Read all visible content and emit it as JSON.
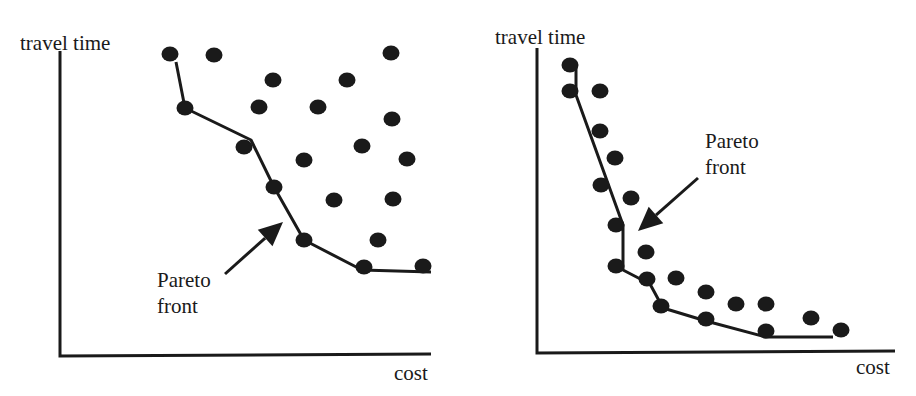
{
  "figure": {
    "panels": [
      {
        "id": "left",
        "y_axis_label": "travel time",
        "x_axis_label": "cost",
        "annotation": {
          "line1": "Pareto",
          "line2": "front"
        },
        "label_pos": {
          "ylabel": [
            20,
            50
          ],
          "xlabel": [
            394,
            380
          ],
          "ann1": [
            157,
            287
          ],
          "ann2": [
            157,
            313
          ]
        },
        "axis": {
          "origin": [
            60,
            356
          ],
          "y_top": 51,
          "x_end": 431
        },
        "arrow": {
          "tail": [
            225,
            274
          ],
          "tip": [
            283,
            222
          ]
        },
        "points": [
          [
            170,
            54
          ],
          [
            214,
            55
          ],
          [
            391,
            53
          ],
          [
            273,
            80
          ],
          [
            347,
            80
          ],
          [
            185,
            108
          ],
          [
            259,
            107
          ],
          [
            318,
            107
          ],
          [
            392,
            119
          ],
          [
            244,
            147
          ],
          [
            362,
            146
          ],
          [
            304,
            160
          ],
          [
            407,
            159
          ],
          [
            274,
            187
          ],
          [
            334,
            200
          ],
          [
            393,
            199
          ],
          [
            304,
            240
          ],
          [
            378,
            240
          ],
          [
            364,
            267
          ],
          [
            423,
            266
          ]
        ],
        "pareto_front": [
          [
            176,
            62
          ],
          [
            185,
            108
          ],
          [
            251,
            140
          ],
          [
            274,
            187
          ],
          [
            304,
            240
          ],
          [
            362,
            270
          ],
          [
            431,
            272
          ]
        ]
      },
      {
        "id": "right",
        "y_axis_label": "travel time",
        "x_axis_label": "cost",
        "annotation": {
          "line1": "Pareto",
          "line2": "front"
        },
        "label_pos": {
          "ylabel": [
            495,
            44
          ],
          "xlabel": [
            856,
            374
          ],
          "ann1": [
            705,
            148
          ],
          "ann2": [
            705,
            174
          ]
        },
        "axis": {
          "origin": [
            537,
            353
          ],
          "y_top": 48,
          "x_end": 895
        },
        "arrow": {
          "tail": [
            698,
            178
          ],
          "tip": [
            638,
            231
          ]
        },
        "points": [
          [
            570,
            65
          ],
          [
            570,
            91
          ],
          [
            600,
            91
          ],
          [
            600,
            131
          ],
          [
            615,
            158
          ],
          [
            601,
            185
          ],
          [
            631,
            198
          ],
          [
            616,
            225
          ],
          [
            646,
            252
          ],
          [
            616,
            266
          ],
          [
            647,
            279
          ],
          [
            676,
            278
          ],
          [
            661,
            306
          ],
          [
            706,
            292
          ],
          [
            706,
            319
          ],
          [
            736,
            304
          ],
          [
            766,
            304
          ],
          [
            766,
            331
          ],
          [
            811,
            318
          ],
          [
            841,
            330
          ]
        ],
        "pareto_front": [
          [
            576,
            68
          ],
          [
            576,
            95
          ],
          [
            623,
            225
          ],
          [
            623,
            270
          ],
          [
            650,
            284
          ],
          [
            663,
            308
          ],
          [
            706,
            321
          ],
          [
            766,
            337
          ],
          [
            833,
            337
          ]
        ]
      }
    ]
  }
}
